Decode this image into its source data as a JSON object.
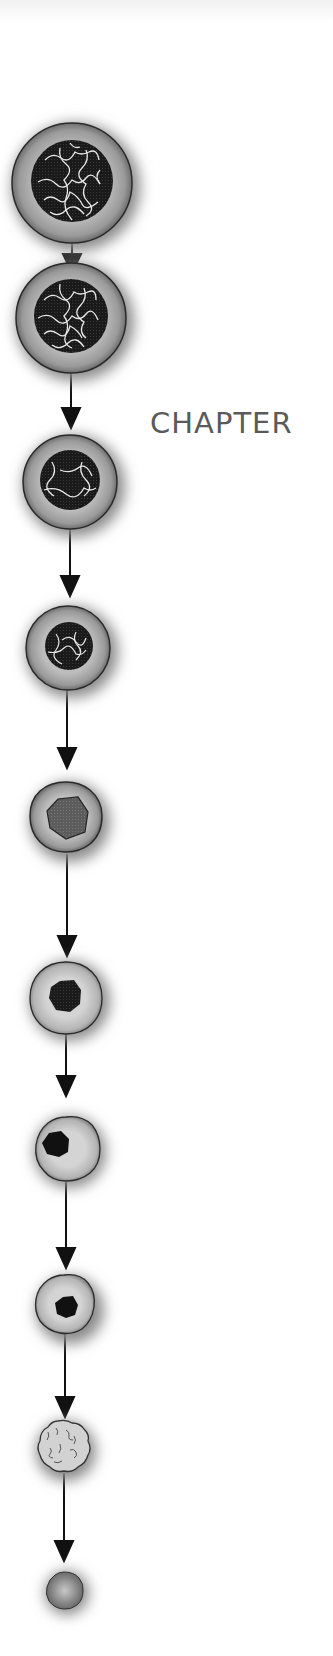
{
  "page": {
    "heading": "CHAPTER"
  },
  "diagram": {
    "colors": {
      "cytoplasm": "#a8a8a8",
      "nucleus": "#1c1c1c",
      "chromatin_lines": "#e6e6e6",
      "outline": "#2a2a2a",
      "arrow": "#111111",
      "heading_text": "#5a5a5a"
    },
    "stages": [
      {
        "index": 1,
        "cx": 72,
        "cy": 183,
        "r": 60,
        "nucleus_r": 40,
        "type": "chromatin-network"
      },
      {
        "index": 2,
        "cx": 71,
        "cy": 318,
        "r": 55,
        "nucleus_r": 37,
        "type": "chromatin-network"
      },
      {
        "index": 3,
        "cx": 70,
        "cy": 482,
        "r": 47,
        "nucleus_r": 30,
        "type": "chromatin-sparse"
      },
      {
        "index": 4,
        "cx": 68,
        "cy": 648,
        "r": 42,
        "nucleus_r": 23,
        "type": "chromatin-sparse"
      },
      {
        "index": 5,
        "cx": 66,
        "cy": 818,
        "r": 36,
        "nucleus_r": 22,
        "type": "nucleus-gray"
      },
      {
        "index": 6,
        "cx": 66,
        "cy": 997,
        "r": 36,
        "nucleus_r": 17,
        "type": "nucleus-dark"
      },
      {
        "index": 7,
        "cx": 66,
        "cy": 1148,
        "r": 32,
        "nucleus_r": 13,
        "type": "nucleus-eccentric"
      },
      {
        "index": 8,
        "cx": 66,
        "cy": 1306,
        "r": 30,
        "nucleus_r": 11,
        "type": "nucleus-small"
      },
      {
        "index": 9,
        "cx": 62,
        "cy": 1447,
        "r": 26,
        "nucleus_r": 0,
        "type": "anucleate-wrinkled"
      },
      {
        "index": 10,
        "cx": 64,
        "cy": 1590,
        "r": 19,
        "nucleus_r": 0,
        "type": "anucleate-sphere"
      }
    ]
  }
}
